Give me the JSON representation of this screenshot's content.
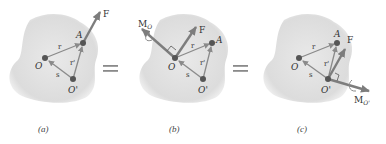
{
  "figure": {
    "panels": [
      {
        "id": "a",
        "caption": "(a)",
        "labels": {
          "O": "O",
          "A": "A",
          "O_prime": "O'",
          "F": "F",
          "r": "r",
          "r_prime": "r'",
          "s": "s"
        }
      },
      {
        "id": "b",
        "caption": "(b)",
        "labels": {
          "O": "O",
          "A": "A",
          "O_prime": "O'",
          "F": "F",
          "r": "r",
          "r_prime": "r'",
          "s": "s",
          "M": "M",
          "M_sub": "O"
        }
      },
      {
        "id": "c",
        "caption": "(c)",
        "labels": {
          "O": "O",
          "A": "A",
          "O_prime": "O'",
          "F": "F",
          "r": "r",
          "r_prime": "r'",
          "s": "s",
          "M": "M",
          "M_sub": "O'"
        }
      }
    ],
    "equals": [
      "=",
      "="
    ],
    "colors": {
      "body": "#e2e2e2",
      "arrow": "#8a8a8a",
      "force": "#7d7d7d",
      "point": "#555555",
      "text": "#333333"
    }
  }
}
